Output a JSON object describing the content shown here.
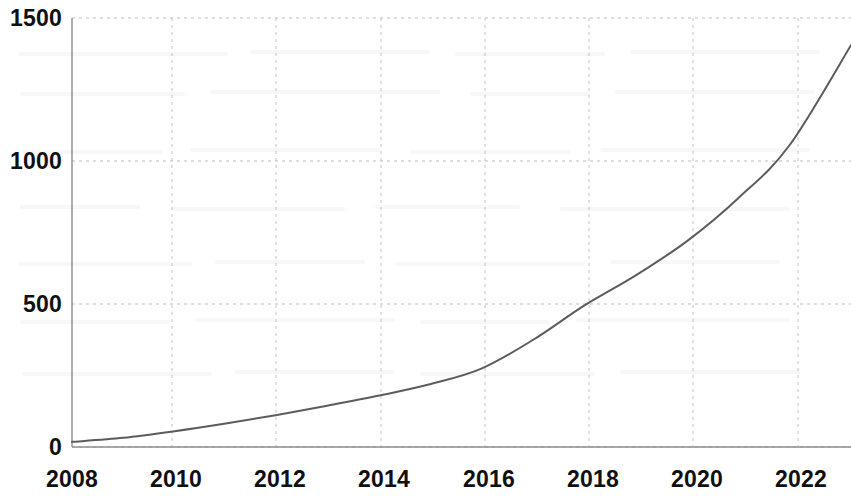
{
  "chart_data": {
    "type": "line",
    "title": "",
    "subtitle": "",
    "xlabel": "",
    "ylabel": "",
    "xlim": [
      2008,
      2023.2
    ],
    "ylim": [
      0,
      1500
    ],
    "grid": true,
    "grid_style": "dotted",
    "legend": null,
    "legend_position": "none",
    "line_color": "#5c5c5c",
    "line_width": 2,
    "axis_color": "#8d8d8d",
    "background": "#ffffff",
    "x_tick_labels": [
      "2008",
      "2010",
      "2012",
      "2014",
      "2016",
      "2018",
      "2020",
      "2022"
    ],
    "x_tick_values": [
      2008,
      2010,
      2012,
      2014,
      2016,
      2018,
      2020,
      2022
    ],
    "y_tick_labels": [
      "0",
      "500",
      "1000",
      "1500"
    ],
    "y_tick_values": [
      0,
      500,
      1000,
      1500
    ],
    "series": [
      {
        "name": "series-1",
        "x": [
          2008,
          2009,
          2010,
          2011,
          2012,
          2013,
          2014,
          2015,
          2016,
          2017,
          2018,
          2019,
          2020,
          2021,
          2022,
          2023.2
        ],
        "values": [
          18,
          32,
          55,
          82,
          112,
          145,
          180,
          220,
          275,
          375,
          495,
          600,
          720,
          870,
          1055,
          1405
        ]
      }
    ]
  },
  "axes": {
    "y_axis_name": "y-axis",
    "x_axis_name": "x-axis"
  }
}
